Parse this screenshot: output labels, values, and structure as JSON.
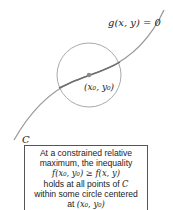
{
  "diagram": {
    "curve_label": "g(x, y) = 0",
    "point_label": "(x₀, y₀)",
    "curve_name": "C",
    "colors": {
      "curve": "#9a9a9a",
      "curve_inside": "#707070",
      "circle": "#aaaaaa",
      "point": "#8a8a8a",
      "text": "#222222"
    }
  },
  "caption": {
    "line1": "At a constrained relative",
    "line2": "maximum, the inequality",
    "line3": "f(x₀, y₀) ≥ f(x, y)",
    "line4_text": "holds at all points of ",
    "line4_math": "C",
    "line5": "within some circle centered",
    "line6_text": "at ",
    "line6_math": "(x₀, y₀)"
  }
}
